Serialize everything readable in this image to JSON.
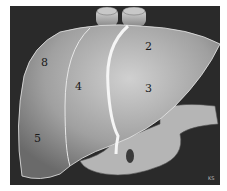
{
  "figure": {
    "segments": [
      {
        "label": "2",
        "x": 145,
        "y": 50
      },
      {
        "label": "8",
        "x": 45,
        "y": 64
      },
      {
        "label": "4",
        "x": 76,
        "y": 88
      },
      {
        "label": "3",
        "x": 146,
        "y": 90
      },
      {
        "label": "5",
        "x": 36,
        "y": 140
      }
    ],
    "signature": "KS",
    "colors": {
      "background": "#2a2a2a",
      "liver": "#a8a8a8",
      "border": "#ffffff"
    }
  }
}
